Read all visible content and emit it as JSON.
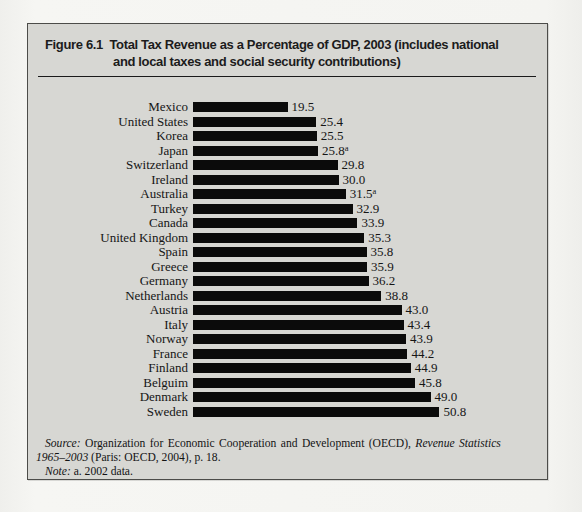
{
  "figure": {
    "title_line1": "Figure 6.1  Total Tax Revenue as a Percentage of GDP, 2003 (includes national",
    "title_line2": "and local taxes and social security contributions)"
  },
  "chart_data": {
    "type": "bar",
    "orientation": "horizontal",
    "title": "Total Tax Revenue as a Percentage of GDP, 2003 (includes national and local taxes and social security contributions)",
    "value_unit": "percent of GDP",
    "xlim": [
      0,
      52
    ],
    "grid": false,
    "legend": false,
    "categories": [
      "Mexico",
      "United States",
      "Korea",
      "Japan",
      "Switzerland",
      "Ireland",
      "Australia",
      "Turkey",
      "Canada",
      "United Kingdom",
      "Spain",
      "Greece",
      "Germany",
      "Netherlands",
      "Austria",
      "Italy",
      "Norway",
      "France",
      "Finland",
      "Belguim",
      "Denmark",
      "Sweden"
    ],
    "values": [
      19.5,
      25.4,
      25.5,
      25.8,
      29.8,
      30.0,
      31.5,
      32.9,
      33.9,
      35.3,
      35.8,
      35.9,
      36.2,
      38.8,
      43.0,
      43.4,
      43.9,
      44.2,
      44.9,
      45.8,
      49.0,
      50.8
    ],
    "note_marker": "a",
    "noted_indices": [
      3,
      6
    ]
  },
  "source": {
    "line1": [
      {
        "t": "Source:",
        "i": 1
      },
      {
        "t": " Organization for Economic Cooperation and Development (OECD), ",
        "i": 0
      },
      {
        "t": "Revenue Statistics",
        "i": 1
      }
    ],
    "line2": [
      {
        "t": "1965–2003",
        "i": 1
      },
      {
        "t": " (Paris: OECD, 2004), p. 18.",
        "i": 0
      }
    ],
    "note": [
      {
        "t": "Note:",
        "i": 1
      },
      {
        "t": " a. 2002 data.",
        "i": 0
      }
    ]
  },
  "colors": {
    "page_bg": "#f4f4f1",
    "box_bg": "#d7d7d3",
    "box_border": "#4c4c49",
    "bar": "#0b0b0b",
    "text": "#151515"
  }
}
